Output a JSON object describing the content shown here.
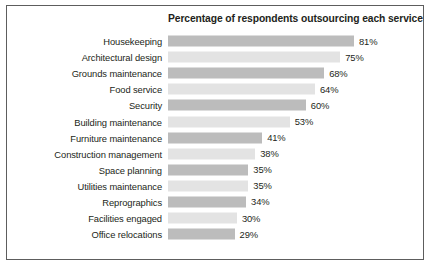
{
  "chart_data": {
    "type": "bar",
    "orientation": "horizontal",
    "title": "Percentage of respondents outsourcing each service",
    "xlabel": "",
    "ylabel": "",
    "xlim": [
      0,
      100
    ],
    "grid": false,
    "legend": null,
    "unit": "%",
    "colors": {
      "bar_dark": "#bcbcbc",
      "bar_light": "#e3e3e3",
      "border": "#5d5d5d",
      "text": "#231f20",
      "background": "#ffffff"
    },
    "categories": [
      "Housekeeping",
      "Architectural design",
      "Grounds maintenance",
      "Food service",
      "Security",
      "Building maintenance",
      "Furniture maintenance",
      "Construction management",
      "Space planning",
      "Utilities maintenance",
      "Reprographics",
      "Facilities engaged",
      "Office relocations"
    ],
    "values": [
      81,
      75,
      68,
      64,
      60,
      53,
      41,
      38,
      35,
      35,
      34,
      30,
      29
    ],
    "value_labels": [
      "81%",
      "75%",
      "68%",
      "64%",
      "60%",
      "53%",
      "41%",
      "38%",
      "35%",
      "35%",
      "34%",
      "30%",
      "29%"
    ],
    "bar_shades": [
      "dark",
      "light",
      "dark",
      "light",
      "dark",
      "light",
      "dark",
      "light",
      "dark",
      "light",
      "dark",
      "light",
      "dark"
    ]
  }
}
